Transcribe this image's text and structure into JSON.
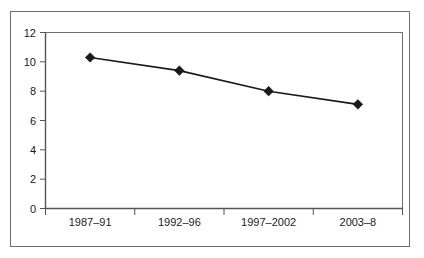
{
  "chart_data": {
    "type": "line",
    "title": "",
    "subtitle": "",
    "xlabel": "",
    "ylabel": "",
    "categories": [
      "1987–91",
      "1992–96",
      "1997–2002",
      "2003–8"
    ],
    "values": [
      10.3,
      9.4,
      8.0,
      7.1
    ],
    "series": [
      {
        "name": "",
        "values": [
          10.3,
          9.4,
          8.0,
          7.1
        ]
      }
    ],
    "ylim": [
      0,
      12
    ],
    "ytick_labels": [
      "0",
      "2",
      "4",
      "6",
      "8",
      "10",
      "12"
    ],
    "ytick_values": [
      0,
      2,
      4,
      6,
      8,
      10,
      12
    ],
    "grid": false,
    "legend": "none",
    "marker": "diamond",
    "line_color": "#1a1a1a",
    "marker_color": "#1a1a1a",
    "axis_color": "#6e6e6e",
    "frame_color": "#6e6e6e",
    "background_color": "#ffffff",
    "annotations": []
  },
  "figure": {
    "frame_label": "chart-outer-frame",
    "plot_label": "plot-area"
  }
}
